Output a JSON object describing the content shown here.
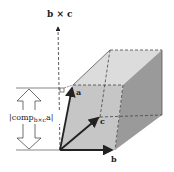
{
  "diagram": {
    "labels": {
      "axis": "b × c",
      "vector_a": "a",
      "vector_b": "b",
      "vector_c": "c",
      "height_prefix": "|comp",
      "height_sub": "b×c",
      "height_suffix": "a|"
    },
    "colors": {
      "front_face": "#c9c9c9",
      "top_face": "#dcdcdc",
      "side_face": "#9a9a9a",
      "edge": "#333333",
      "vector": "#222222"
    }
  }
}
